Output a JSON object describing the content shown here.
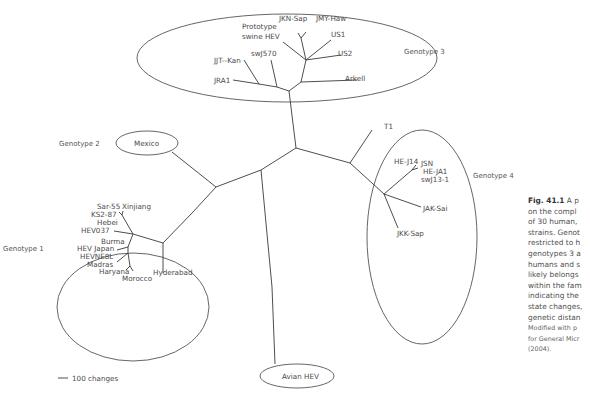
{
  "figure": {
    "type": "unrooted phylogenetic tree",
    "scale_bar": {
      "label": "100 changes"
    },
    "genotype_labels": {
      "g1": "Genotype 1",
      "g2": "Genotype 2",
      "g3": "Genotype 3",
      "g4": "Genotype 4"
    },
    "genotype1_strains": {
      "sar55": "Sar-55",
      "xinjiang": "Xinjiang",
      "ks287": "KS2-87",
      "hebei": "Hebei",
      "hev037": "HEV037",
      "burma": "Burma",
      "hevjapan": "HEV Japan",
      "hevne8l": "HEVNE8L",
      "madras": "Madras",
      "haryana": "Haryana",
      "morocco": "Morocco",
      "hyderabad": "Hyderabad"
    },
    "genotype2_strains": {
      "mexico": "Mexico"
    },
    "genotype3_strains": {
      "jknsap": "JKN-Sap",
      "jmyhaw": "JMY-Haw",
      "prototype1": "Prototype",
      "prototype2": "swine HEV",
      "us1": "US1",
      "us2": "US2",
      "swj570": "swJ570",
      "jitkan": "JJT--Kan",
      "jra1": "JRA1",
      "arkell": "Arkell"
    },
    "genotype4_strains": {
      "t1": "T1",
      "hej14": "HE-J14",
      "jsn": "JSN",
      "heja1": "HE-JA1",
      "swj131": "swJ13-1",
      "jaksai": "JAK-Sai",
      "jkksap": "JKK-Sap"
    },
    "avian": {
      "label": "Avian HEV"
    }
  },
  "caption": {
    "fig_number": "Fig. 41.1",
    "lines": [
      "A p",
      "on the compl",
      "of 30 human,",
      "strains. Genot",
      "restricted to h",
      "genotypes 3 a",
      "humans and s",
      "likely belongs",
      "within the fam",
      "indicating the",
      "state changes,",
      "genetic distan"
    ],
    "source_lines": [
      "Modified with p",
      "for General Micr",
      "(2004)."
    ]
  }
}
